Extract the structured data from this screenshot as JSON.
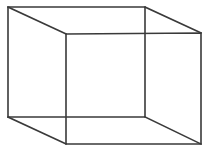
{
  "figure": {
    "type": "line-drawing",
    "canvas": {
      "width": 209,
      "height": 157,
      "background_color": "#ffffff"
    },
    "style": {
      "stroke_color": "#3a3a3a",
      "stroke_width": 1.6,
      "fill": "none"
    },
    "geometry": {
      "back_face": {
        "name": "upper-left-square-face",
        "points": "8,7 145,7 145,117 8,117",
        "vertices": [
          {
            "label": "back-top-left",
            "x": 8,
            "y": 7
          },
          {
            "label": "back-top-right",
            "x": 145,
            "y": 7
          },
          {
            "label": "back-bottom-right",
            "x": 145,
            "y": 117
          },
          {
            "label": "back-bottom-left",
            "x": 8,
            "y": 117
          }
        ]
      },
      "front_face": {
        "name": "lower-right-square-face",
        "points": "66,34 201,33 201,144 66,144",
        "vertices": [
          {
            "label": "front-top-left",
            "x": 66,
            "y": 34
          },
          {
            "label": "front-top-right",
            "x": 201,
            "y": 33
          },
          {
            "label": "front-bottom-right",
            "x": 201,
            "y": 144
          },
          {
            "label": "front-bottom-left",
            "x": 66,
            "y": 144
          }
        ]
      },
      "connectors": [
        {
          "label": "connector-top-left",
          "x1": 8,
          "y1": 7,
          "x2": 66,
          "y2": 34
        },
        {
          "label": "connector-top-right",
          "x1": 145,
          "y1": 7,
          "x2": 201,
          "y2": 33
        },
        {
          "label": "connector-bottom-right",
          "x1": 145,
          "y1": 117,
          "x2": 201,
          "y2": 144
        },
        {
          "label": "connector-bottom-left",
          "x1": 8,
          "y1": 117,
          "x2": 66,
          "y2": 144
        }
      ]
    }
  }
}
